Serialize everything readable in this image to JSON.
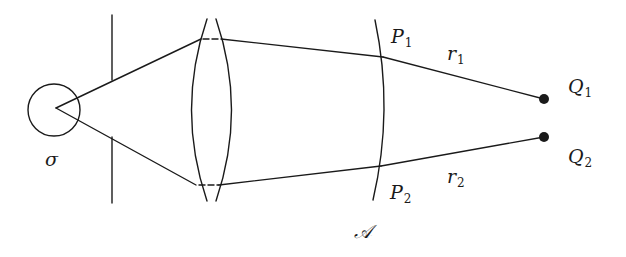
{
  "diagram": {
    "title": "",
    "colors": {
      "stroke": "#1a1a1a",
      "background": "#ffffff"
    },
    "labels": {
      "source": {
        "text": "σ",
        "sub": ""
      },
      "p1": {
        "text": "P",
        "sub": "1"
      },
      "p2": {
        "text": "P",
        "sub": "2"
      },
      "r1": {
        "text": "r",
        "sub": "1"
      },
      "r2": {
        "text": "r",
        "sub": "2"
      },
      "q1": {
        "text": "Q",
        "sub": "1"
      },
      "q2": {
        "text": "Q",
        "sub": "2"
      },
      "wavefront": {
        "text": "𝒜",
        "sub": ""
      }
    },
    "elements": {
      "source_circle": {
        "cx": 54,
        "cy": 110,
        "r": 26
      },
      "source_point": {
        "x": 56,
        "y": 108
      },
      "screen_x": 112,
      "screen_top": [
        15,
        80
      ],
      "screen_bottom": [
        137,
        203
      ],
      "lens": {
        "x_left": 192,
        "x_right": 230,
        "y_top": 19,
        "y_bottom": 201
      },
      "wavefront_arc": {
        "x": 383,
        "y_top": 20,
        "y_bottom": 200
      },
      "q1_point": {
        "x": 544,
        "y": 99
      },
      "q2_point": {
        "x": 544,
        "y": 137
      }
    }
  }
}
